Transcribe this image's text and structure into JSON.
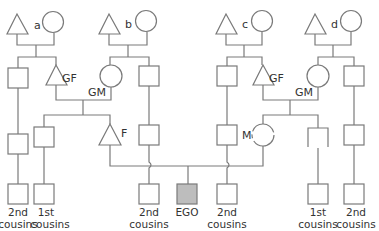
{
  "diagram": {
    "colors": {
      "line": "#7a7a7a",
      "shape_fill": "#ffffff",
      "ego_fill": "#bdbdbd",
      "text": "#333333"
    },
    "great_grandparent_labels": {
      "a": "a",
      "b": "b",
      "c": "c",
      "d": "d"
    },
    "labels": {
      "gf_left": "GF",
      "gm_left": "GM",
      "gf_right": "GF",
      "gm_right": "GM",
      "father": "F",
      "mother": "M"
    },
    "bottom_row": [
      {
        "id": "c1",
        "line1": "2nd",
        "line2": "cousins"
      },
      {
        "id": "c2",
        "line1": "1st",
        "line2": "cousins"
      },
      {
        "id": "c3",
        "line1": "2nd",
        "line2": "cousins"
      },
      {
        "id": "ego",
        "line1": "EGO",
        "line2": ""
      },
      {
        "id": "c4",
        "line1": "2nd",
        "line2": "cousins"
      },
      {
        "id": "c5",
        "line1": "1st",
        "line2": "cousins"
      },
      {
        "id": "c6",
        "line1": "2nd",
        "line2": "cousins"
      }
    ],
    "legend": {
      "triangle": "male",
      "circle": "female",
      "square": "person (sex unspecified)",
      "shaded_square": "EGO"
    }
  }
}
